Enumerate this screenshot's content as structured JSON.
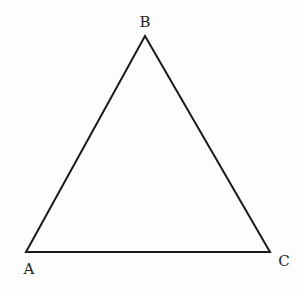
{
  "diagram": {
    "type": "triangle",
    "vertices": [
      {
        "label": "A",
        "x": 26,
        "y": 252,
        "label_x": 29,
        "label_y": 274
      },
      {
        "label": "B",
        "x": 145,
        "y": 36,
        "label_x": 145,
        "label_y": 27
      },
      {
        "label": "C",
        "x": 270,
        "y": 252,
        "label_x": 284,
        "label_y": 266
      }
    ],
    "stroke_color": "#1a1a1a",
    "stroke_width": 2
  }
}
